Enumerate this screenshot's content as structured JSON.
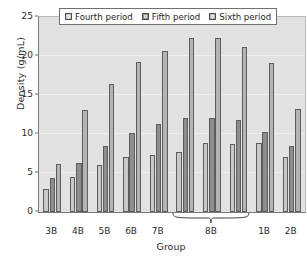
{
  "chart_data": {
    "type": "bar",
    "title": "",
    "xlabel": "Group",
    "ylabel": "Density (g/mL)",
    "ylim": [
      0,
      25
    ],
    "yticks": [
      0,
      5,
      10,
      15,
      20,
      25
    ],
    "grid": true,
    "legend_position": "top-center",
    "categories": [
      "3B",
      "4B",
      "5B",
      "6B",
      "7B",
      "8B",
      "8B",
      "8B",
      "1B",
      "2B"
    ],
    "category_labels": [
      "3B",
      "4B",
      "5B",
      "6B",
      "7B",
      "8B",
      "1B",
      "2B"
    ],
    "grouped_label_note": "8B spans three adjacent bar clusters marked by a brace",
    "series": [
      {
        "name": "Fourth period",
        "color": "#c8c8c8",
        "values": [
          2.9,
          4.5,
          6.0,
          7.1,
          7.3,
          7.7,
          8.8,
          8.7,
          8.8,
          7.0
        ]
      },
      {
        "name": "Fifth period",
        "color": "#8e8e8e",
        "values": [
          4.4,
          6.3,
          8.4,
          10.1,
          11.3,
          12.1,
          12.1,
          11.8,
          10.2,
          8.4
        ]
      },
      {
        "name": "Sixth period",
        "color": "#b4b4b4",
        "values": [
          6.1,
          13.1,
          16.4,
          19.2,
          20.7,
          22.3,
          22.3,
          21.2,
          19.1,
          13.2
        ]
      }
    ]
  },
  "legend": {
    "items": [
      {
        "label": "Fourth period",
        "swatch_icon": "square-swatch-icon"
      },
      {
        "label": "Fifth period",
        "swatch_icon": "square-swatch-icon"
      },
      {
        "label": "Sixth period",
        "swatch_icon": "square-swatch-icon"
      }
    ]
  },
  "axes": {
    "y_title": "Density (g/mL)",
    "x_title": "Group",
    "y_tick_labels": [
      "0",
      "5",
      "10",
      "15",
      "20",
      "25"
    ],
    "x_tick_labels": [
      "3B",
      "4B",
      "5B",
      "6B",
      "7B",
      "8B",
      "1B",
      "2B"
    ]
  },
  "colors": {
    "plot_background": "#e2e2e2",
    "page_background": "#ffffff",
    "axis": "#7a7a7a",
    "gridline": "#efefef",
    "bar_outline": "#5d5d5d",
    "text": "#2b2b2b"
  }
}
